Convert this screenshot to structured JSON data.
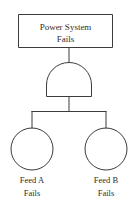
{
  "diagram": {
    "type": "fault-tree",
    "canvas": {
      "width": 140,
      "height": 211
    },
    "colors": {
      "background": "#ffffff",
      "stroke": "#3c3c3c",
      "text": "#2e2e2e"
    },
    "top_event": {
      "shape": "rectangle",
      "label_line1": "Power System",
      "label_line2": "Fails"
    },
    "gate": {
      "shape": "and-gate",
      "label": "AND"
    },
    "basic_events": [
      {
        "shape": "circle",
        "label_line1": "Feed A",
        "label_line2": "Fails"
      },
      {
        "shape": "circle",
        "label_line1": "Feed B",
        "label_line2": "Fails"
      }
    ]
  }
}
